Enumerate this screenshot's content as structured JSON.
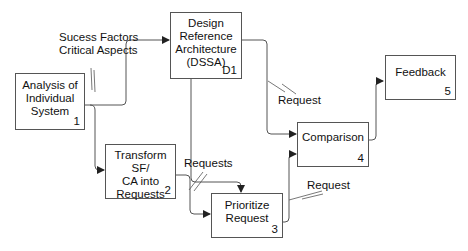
{
  "diagram": {
    "type": "process-flow",
    "colors": {
      "line": "#555555",
      "text": "#111111",
      "background": "#ffffff"
    },
    "boxes": [
      {
        "id": "1",
        "lines": [
          "Analysis of",
          "Individual",
          "System"
        ],
        "number": "1"
      },
      {
        "id": "D1",
        "lines": [
          "Design",
          "Reference",
          "Architecture",
          "(DSSA)"
        ],
        "number": "D1"
      },
      {
        "id": "2",
        "lines": [
          "Transform SF/",
          "CA into",
          "Requests"
        ],
        "number": "2"
      },
      {
        "id": "3",
        "lines": [
          "Prioritize",
          "Request"
        ],
        "number": "3"
      },
      {
        "id": "4",
        "lines": [
          "Comparison"
        ],
        "number": "4"
      },
      {
        "id": "5",
        "lines": [
          "Feedback"
        ],
        "number": "5"
      }
    ],
    "flows": [
      {
        "from": "1",
        "to": "D1",
        "label_lines": [
          "Sucess Factors",
          "Critical Aspects"
        ]
      },
      {
        "from": "1",
        "to": "2",
        "label_lines": []
      },
      {
        "from": "2",
        "to": "3",
        "label_lines": [
          "Requests"
        ]
      },
      {
        "from": "D1",
        "to": "3",
        "label_lines": []
      },
      {
        "from": "D1",
        "to": "4",
        "label_lines": [
          "Request"
        ]
      },
      {
        "from": "3",
        "to": "4",
        "label_lines": [
          "Request"
        ]
      },
      {
        "from": "4",
        "to": "5",
        "label_lines": []
      }
    ]
  }
}
